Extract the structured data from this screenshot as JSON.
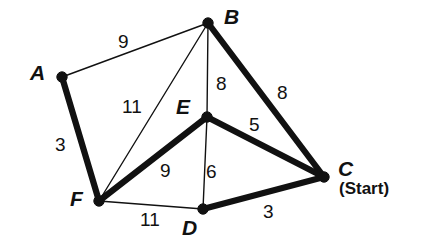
{
  "figure": {
    "background_color": "#ffffff",
    "stroke_color": "#111111"
  },
  "chart_data": {
    "type": "diagram",
    "title": "",
    "subtitle": "",
    "xlabel": "",
    "ylabel": "",
    "nodes": [
      {
        "id": "A",
        "label": "A",
        "x": 62,
        "y": 77,
        "label_x": 30,
        "label_y": 62,
        "start": false
      },
      {
        "id": "B",
        "label": "B",
        "x": 208,
        "y": 23,
        "label_x": 224,
        "label_y": 6,
        "start": false
      },
      {
        "id": "C",
        "label": "C",
        "x": 324,
        "y": 177,
        "label_x": 338,
        "label_y": 158,
        "start": true
      },
      {
        "id": "D",
        "label": "D",
        "x": 203,
        "y": 209,
        "label_x": 182,
        "label_y": 217,
        "start": false
      },
      {
        "id": "E",
        "label": "E",
        "x": 207,
        "y": 117,
        "label_x": 176,
        "label_y": 96,
        "start": false
      },
      {
        "id": "F",
        "label": "F",
        "x": 99,
        "y": 201,
        "label_x": 70,
        "label_y": 188,
        "start": false
      }
    ],
    "edges": [
      {
        "from": "A",
        "to": "B",
        "weight": 9,
        "highlighted": false,
        "label_x": 118,
        "label_y": 32
      },
      {
        "from": "A",
        "to": "F",
        "weight": 3,
        "highlighted": true,
        "label_x": 55,
        "label_y": 135
      },
      {
        "from": "B",
        "to": "E",
        "weight": 8,
        "highlighted": false,
        "label_x": 216,
        "label_y": 74
      },
      {
        "from": "B",
        "to": "C",
        "weight": 8,
        "highlighted": true,
        "label_x": 277,
        "label_y": 83
      },
      {
        "from": "B",
        "to": "F",
        "weight": 11,
        "highlighted": false,
        "label_x": 122,
        "label_y": 97
      },
      {
        "from": "E",
        "to": "C",
        "weight": 5,
        "highlighted": true,
        "label_x": 249,
        "label_y": 115
      },
      {
        "from": "E",
        "to": "D",
        "weight": 6,
        "highlighted": false,
        "label_x": 206,
        "label_y": 162
      },
      {
        "from": "E",
        "to": "F",
        "weight": 9,
        "highlighted": true,
        "label_x": 160,
        "label_y": 161
      },
      {
        "from": "F",
        "to": "D",
        "weight": 11,
        "highlighted": false,
        "label_x": 140,
        "label_y": 210
      },
      {
        "from": "D",
        "to": "C",
        "weight": 3,
        "highlighted": true,
        "label_x": 263,
        "label_y": 202
      }
    ],
    "start_node": "C",
    "start_label": "(Start)",
    "legend": [],
    "annotations": []
  }
}
